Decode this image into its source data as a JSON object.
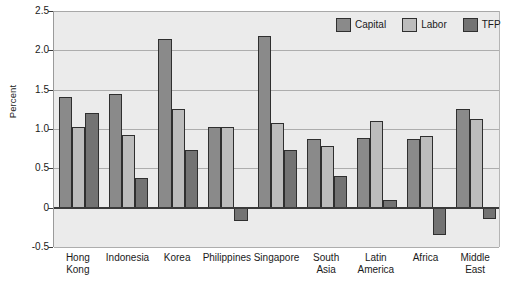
{
  "chart_data": {
    "type": "bar",
    "title": "",
    "xlabel": "",
    "ylabel": "Percent",
    "ylim": [
      -0.5,
      2.5
    ],
    "ytick_labels": [
      "2.5",
      "2.0",
      "1.5",
      "1.0",
      "0.5",
      "0",
      "-0.5"
    ],
    "ytick_values": [
      2.5,
      2.0,
      1.5,
      1.0,
      0.5,
      0,
      -0.5
    ],
    "grid": true,
    "legend_position": "top-right",
    "categories": [
      "Hong Kong",
      "Indonesia",
      "Korea",
      "Philippines",
      "Singapore",
      "South Asia",
      "Latin America",
      "Africa",
      "Middle East"
    ],
    "category_lines": [
      [
        "Hong",
        "Kong"
      ],
      [
        "Indonesia",
        ""
      ],
      [
        "Korea",
        ""
      ],
      [
        "Philippines",
        ""
      ],
      [
        "Singapore",
        ""
      ],
      [
        "South",
        "Asia"
      ],
      [
        "Latin",
        "America"
      ],
      [
        "Africa",
        ""
      ],
      [
        "Middle",
        "East"
      ]
    ],
    "series": [
      {
        "name": "Capital",
        "color": "#8a8a8a",
        "values": [
          1.41,
          1.45,
          2.15,
          1.03,
          2.18,
          0.87,
          0.88,
          0.87,
          1.26
        ]
      },
      {
        "name": "Labor",
        "color": "#bcbcbc",
        "values": [
          1.03,
          0.93,
          1.25,
          1.03,
          1.08,
          0.78,
          1.1,
          0.91,
          1.13
        ]
      },
      {
        "name": "TFP",
        "color": "#737373",
        "values": [
          1.2,
          0.38,
          0.73,
          -0.17,
          0.73,
          0.4,
          0.1,
          -0.35,
          -0.14
        ]
      }
    ]
  },
  "legend": {
    "items": [
      {
        "label": "Capital",
        "color": "#8a8a8a"
      },
      {
        "label": "Labor",
        "color": "#bcbcbc"
      },
      {
        "label": "TFP",
        "color": "#737373"
      }
    ]
  },
  "axis": {
    "y_title": "Percent"
  },
  "colors": {
    "plot_background": "#ebebeb",
    "page_background": "#ffffff",
    "gridline": "#adadad",
    "zero_line": "#3a3a3a",
    "bar_outline": "#2f2f2f"
  }
}
